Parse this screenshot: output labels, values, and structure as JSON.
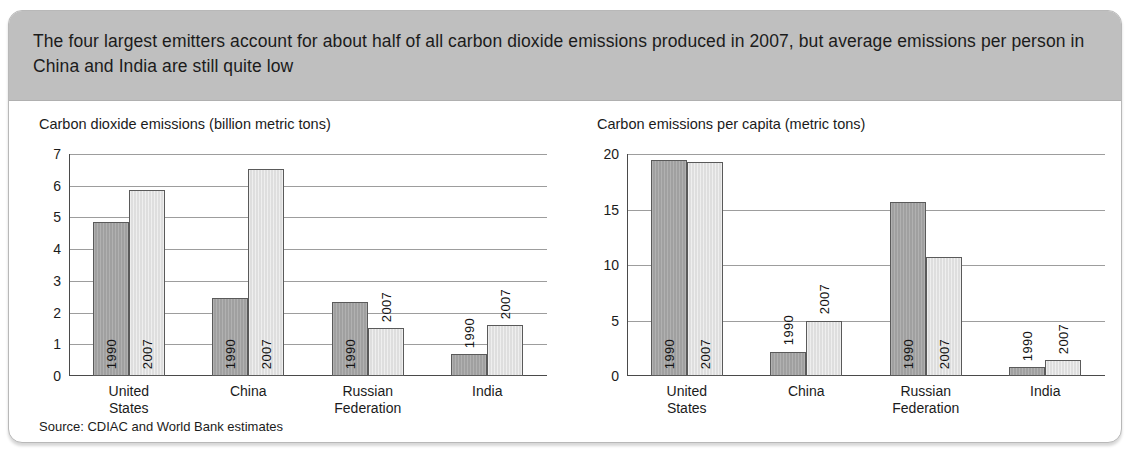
{
  "header": {
    "text": "The four largest emitters account for about half of all carbon dioxide emissions produced in 2007, but average emissions per person in China and India are still quite low"
  },
  "source": {
    "label": "Source: CDIAC and World Bank estimates"
  },
  "series_labels": {
    "a": "1990",
    "b": "2007"
  },
  "colors": {
    "header_band": "#bfbfbf",
    "bar_1990": "#a0a0a0",
    "bar_2007": "#dedede",
    "bar_outline": "#5a5a5a",
    "gridline": "#9d9d9d",
    "axis": "#4a4a4a",
    "card_border": "#b8b8b8",
    "text": "#1b1b1b"
  },
  "chart_data": [
    {
      "type": "bar",
      "title": "Carbon dioxide emissions (billion metric tons)",
      "xlabel": "",
      "ylabel": "",
      "ylim": [
        0,
        7
      ],
      "yticks": [
        0,
        1,
        2,
        3,
        4,
        5,
        6,
        7
      ],
      "ytick_labels": [
        "0",
        "1",
        "2",
        "3",
        "4",
        "5",
        "6",
        "7"
      ],
      "grid": true,
      "legend": "in-bar labels",
      "categories": [
        "United\nStates",
        "China",
        "Russian\nFederation",
        "India"
      ],
      "series": [
        {
          "name": "1990",
          "values": [
            4.85,
            2.45,
            2.33,
            0.69
          ]
        },
        {
          "name": "2007",
          "values": [
            5.85,
            6.52,
            1.52,
            1.6
          ]
        }
      ]
    },
    {
      "type": "bar",
      "title": "Carbon emissions per capita (metric tons)",
      "xlabel": "",
      "ylabel": "",
      "ylim": [
        0,
        20
      ],
      "yticks": [
        0,
        5,
        10,
        15,
        20
      ],
      "ytick_labels": [
        "0",
        "5",
        "10",
        "15",
        "20"
      ],
      "grid": true,
      "legend": "in-bar labels",
      "categories": [
        "United\nStates",
        "China",
        "Russian\nFederation",
        "India"
      ],
      "series": [
        {
          "name": "1990",
          "values": [
            19.5,
            2.2,
            15.7,
            0.8
          ]
        },
        {
          "name": "2007",
          "values": [
            19.3,
            5.0,
            10.7,
            1.4
          ]
        }
      ]
    }
  ]
}
